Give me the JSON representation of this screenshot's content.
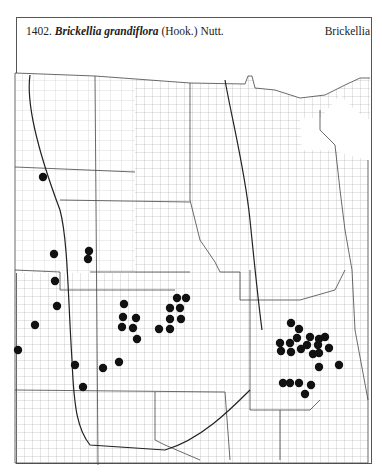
{
  "header": {
    "number": "1402.",
    "scientific_name": "Brickellia grandiflora",
    "authority": "(Hook.) Nutt.",
    "genus_label": "Brickellia"
  },
  "map": {
    "type": "county dot distribution map",
    "region": "Great Plains (Montana/Wyoming/Colorado east to Minnesota/Iowa/Missouri/Arkansas)",
    "dot_color": "#111111",
    "line_color": "#333333",
    "occurrences": [
      {
        "x": 43,
        "y": 177
      },
      {
        "x": 54,
        "y": 254
      },
      {
        "x": 89,
        "y": 251
      },
      {
        "x": 88,
        "y": 259
      },
      {
        "x": 55,
        "y": 281
      },
      {
        "x": 57,
        "y": 306
      },
      {
        "x": 35,
        "y": 325
      },
      {
        "x": 18,
        "y": 350
      },
      {
        "x": 75,
        "y": 365
      },
      {
        "x": 103,
        "y": 368
      },
      {
        "x": 119,
        "y": 362
      },
      {
        "x": 83,
        "y": 387
      },
      {
        "x": 124,
        "y": 304
      },
      {
        "x": 123,
        "y": 317
      },
      {
        "x": 136,
        "y": 318
      },
      {
        "x": 122,
        "y": 327
      },
      {
        "x": 133,
        "y": 328
      },
      {
        "x": 137,
        "y": 339
      },
      {
        "x": 159,
        "y": 329
      },
      {
        "x": 170,
        "y": 329
      },
      {
        "x": 177,
        "y": 298
      },
      {
        "x": 186,
        "y": 298
      },
      {
        "x": 170,
        "y": 308
      },
      {
        "x": 180,
        "y": 308
      },
      {
        "x": 170,
        "y": 319
      },
      {
        "x": 181,
        "y": 319
      },
      {
        "x": 291,
        "y": 323
      },
      {
        "x": 299,
        "y": 329
      },
      {
        "x": 297,
        "y": 338
      },
      {
        "x": 310,
        "y": 337
      },
      {
        "x": 319,
        "y": 339
      },
      {
        "x": 325,
        "y": 337
      },
      {
        "x": 280,
        "y": 343
      },
      {
        "x": 290,
        "y": 343
      },
      {
        "x": 307,
        "y": 345
      },
      {
        "x": 318,
        "y": 345
      },
      {
        "x": 281,
        "y": 351
      },
      {
        "x": 291,
        "y": 352
      },
      {
        "x": 301,
        "y": 349
      },
      {
        "x": 313,
        "y": 354
      },
      {
        "x": 319,
        "y": 353
      },
      {
        "x": 329,
        "y": 348
      },
      {
        "x": 319,
        "y": 367
      },
      {
        "x": 339,
        "y": 365
      },
      {
        "x": 283,
        "y": 383
      },
      {
        "x": 290,
        "y": 383
      },
      {
        "x": 299,
        "y": 383
      },
      {
        "x": 311,
        "y": 385
      },
      {
        "x": 305,
        "y": 394
      }
    ]
  }
}
